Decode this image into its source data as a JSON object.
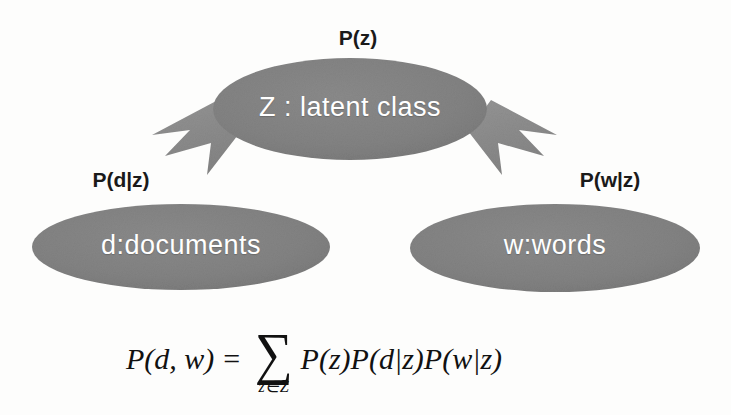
{
  "diagram": {
    "colors": {
      "node_fill": "#808080",
      "node_fill_dark": "#787878",
      "arrow_fill": "#8b8b8b",
      "node_text": "#ffffff",
      "label_text": "#1a1a1a",
      "background": "#fdfdfc"
    },
    "nodes": [
      {
        "id": "z",
        "label": "Z : latent class",
        "shape": "ellipse"
      },
      {
        "id": "d",
        "label": "d:documents",
        "shape": "ellipse"
      },
      {
        "id": "w",
        "label": "w:words",
        "shape": "ellipse"
      }
    ],
    "edges": [
      {
        "id": "z-to-d",
        "label": "P(d|z)",
        "from": "z",
        "to": "d",
        "arrow": "block-arrow-down-left"
      },
      {
        "id": "z-to-w",
        "label": "P(w|z)",
        "from": "z",
        "to": "w",
        "arrow": "block-arrow-down-right"
      }
    ],
    "node_annotation": {
      "z": "P(z)"
    },
    "formula": {
      "lhs_p": "P",
      "lhs_args": "(d, w)",
      "equals": "=",
      "sum_glyph": "∑",
      "sum_subscript": "z∈Z",
      "term1_p": "P",
      "term1_args": "(z)",
      "term2_p": "P",
      "term2_args": "(d|z)",
      "term3_p": "P",
      "term3_args": "(w|z)",
      "plain": "P(d, w) = ∑ z∈Z P(z)P(d|z)P(w|z)"
    }
  }
}
